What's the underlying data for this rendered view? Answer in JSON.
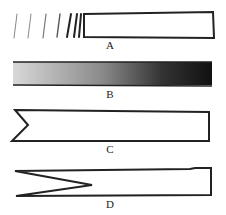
{
  "figure": {
    "panels": [
      {
        "id": "A",
        "label": "A",
        "description": "strip with spaced strokes converging into an open rectangle"
      },
      {
        "id": "B",
        "label": "B",
        "description": "bar shaded from light to dark"
      },
      {
        "id": "C",
        "label": "C",
        "description": "strip with shallow V-notch at left end"
      },
      {
        "id": "D",
        "label": "D",
        "description": "strip with deep V-notch at left end"
      }
    ]
  }
}
